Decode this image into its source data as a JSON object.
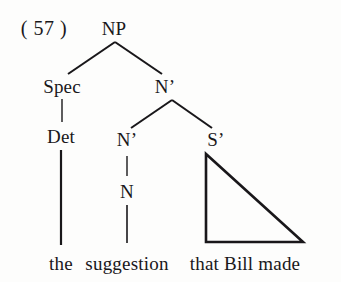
{
  "figure": {
    "example_number": "( 57 )",
    "ink_color": "#19171a",
    "background_color": "#fdfdfc",
    "caption_text": "the suggestion that Bill made"
  },
  "nodes": {
    "np": {
      "label": "NP",
      "x": 114,
      "y": 28
    },
    "spec": {
      "label": "Spec",
      "x": 62,
      "y": 86
    },
    "nbar_upper": {
      "label": "N’",
      "x": 165,
      "y": 86
    },
    "det": {
      "label": "Det",
      "x": 61,
      "y": 136
    },
    "nbar_lower": {
      "label": "N’",
      "x": 127,
      "y": 139
    },
    "sbar": {
      "label": "S’",
      "x": 216,
      "y": 139
    },
    "n": {
      "label": "N",
      "x": 127,
      "y": 191
    }
  },
  "terminals": {
    "the": {
      "label": "the",
      "x": 61,
      "y": 263
    },
    "suggestion": {
      "label": "suggestion",
      "x": 127,
      "y": 263
    },
    "that_bill_made": {
      "label": "that Bill made",
      "x": 245,
      "y": 263
    }
  },
  "edges": {
    "np_to_spec": {
      "x1": 115,
      "y1": 42,
      "x2": 68,
      "y2": 74
    },
    "np_to_nbar": {
      "x1": 115,
      "y1": 42,
      "x2": 162,
      "y2": 74
    },
    "spec_to_det": {
      "x1": 62,
      "y1": 99,
      "x2": 62,
      "y2": 122
    },
    "det_to_the": {
      "x1": 61,
      "y1": 150,
      "x2": 61,
      "y2": 245
    },
    "nbar_to_nbar": {
      "x1": 172,
      "y1": 100,
      "x2": 131,
      "y2": 128
    },
    "nbar_to_sbar": {
      "x1": 172,
      "y1": 100,
      "x2": 212,
      "y2": 128
    },
    "nbar_to_n": {
      "x1": 127,
      "y1": 156,
      "x2": 127,
      "y2": 176
    },
    "n_to_suggestion": {
      "x1": 127,
      "y1": 205,
      "x2": 127,
      "y2": 243
    }
  },
  "triangle": {
    "apex_x": 206,
    "apex_y": 154,
    "left_x": 206,
    "left_y": 242,
    "right_x": 303,
    "right_y": 242
  }
}
